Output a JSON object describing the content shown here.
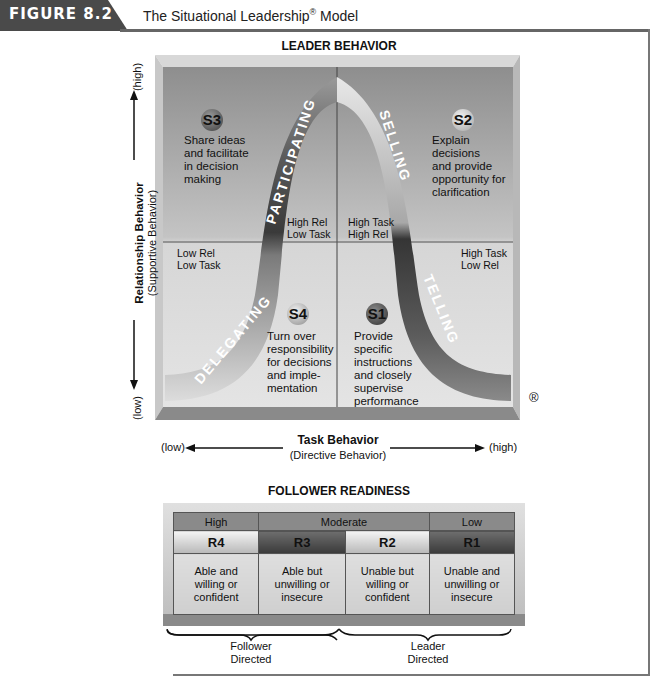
{
  "figure": {
    "number_label": "FIGURE 8.2",
    "title": "The Situational Leadership",
    "title_mark": "®",
    "title_suffix": " Model"
  },
  "leader_behavior": {
    "title": "LEADER BEHAVIOR",
    "y_axis": {
      "title": "Relationship Behavior",
      "subtitle": "(Supportive Behavior)",
      "low": "(low)",
      "high": "(high)"
    },
    "x_axis": {
      "title": "Task Behavior",
      "subtitle": "(Directive Behavior)",
      "low": "(low)",
      "high": "(high)"
    },
    "registered_mark": "®",
    "curve_labels": {
      "participating": "PARTICIPATING",
      "selling": "SELLING",
      "delegating": "DELEGATING",
      "telling": "TELLING"
    },
    "quadrants": {
      "s3": {
        "badge": "S3",
        "description_lines": [
          "Share ideas",
          "and facilitate",
          "in decision",
          "making"
        ],
        "corner_lines": [
          "High Rel",
          "Low Task"
        ]
      },
      "s2": {
        "badge": "S2",
        "description_lines": [
          "Explain",
          "decisions",
          "and provide",
          "opportunity for",
          "clarification"
        ],
        "corner_lines": [
          "High Task",
          "High Rel"
        ]
      },
      "s4": {
        "badge": "S4",
        "description_lines": [
          "Turn over",
          "responsibility",
          "for decisions",
          "and imple-",
          "mentation"
        ],
        "corner_lines": [
          "Low Rel",
          "Low Task"
        ]
      },
      "s1": {
        "badge": "S1",
        "description_lines": [
          "Provide",
          "specific",
          "instructions",
          "and closely",
          "supervise",
          "performance"
        ],
        "corner_lines": [
          "High Task",
          "Low Rel"
        ]
      }
    }
  },
  "follower_readiness": {
    "title": "FOLLOWER READINESS",
    "levels": [
      "High",
      "Moderate",
      "Low"
    ],
    "codes": [
      "R4",
      "R3",
      "R2",
      "R1"
    ],
    "descriptions": [
      [
        "Able and",
        "willing or",
        "confident"
      ],
      [
        "Able but",
        "unwilling or",
        "insecure"
      ],
      [
        "Unable but",
        "willing or",
        "confident"
      ],
      [
        "Unable and",
        "unwilling or",
        "insecure"
      ]
    ],
    "brackets": [
      {
        "line1": "Follower",
        "line2": "Directed"
      },
      {
        "line1": "Leader",
        "line2": "Directed"
      }
    ]
  },
  "colors": {
    "figure_tab": "#4a4a4a",
    "panel_top": "#8c8c8c",
    "panel_bottom": "#e2e2e2",
    "curve_dark": "#3a3a3a",
    "curve_light": "#e8e8e8"
  }
}
